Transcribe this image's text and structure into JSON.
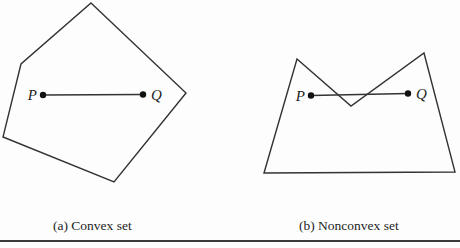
{
  "colors": {
    "background": "#fdfdfd",
    "stroke": "#333333",
    "dot": "#111111",
    "text": "#1e1e1e",
    "rule": "#3a3a3a"
  },
  "figure_a": {
    "caption": "(a) Convex set",
    "polygon_points": "91,3 186,93 114,182 3,137 21,64",
    "segment_path": "M 43,95 L 143,94.5",
    "point_p": {
      "label": "P",
      "dot_path": "M 39.8,95 a 3.2,3.2 0 1 0 6.4,0 a 3.2,3.2 0 1 0 -6.4,0 Z"
    },
    "point_q": {
      "label": "Q",
      "dot_path": "M 139.8,94.5 a 3.2,3.2 0 1 0 6.4,0 a 3.2,3.2 0 1 0 -6.4,0 Z"
    }
  },
  "figure_b": {
    "caption": "(b) Nonconvex set",
    "polygon_points": "264,173 297,59 351,106 424,53 455,172",
    "segment_path": "M 311,95.5 L 408,93.5",
    "point_p": {
      "label": "P",
      "dot_path": "M 307.8,95.5 a 3.2,3.2 0 1 0 6.4,0 a 3.2,3.2 0 1 0 -6.4,0 Z"
    },
    "point_q": {
      "label": "Q",
      "dot_path": "M 404.8,93.5 a 3.2,3.2 0 1 0 6.4,0 a 3.2,3.2 0 1 0 -6.4,0 Z"
    }
  }
}
